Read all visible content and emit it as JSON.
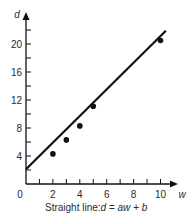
{
  "chart_data": {
    "type": "scatter",
    "title": "",
    "caption": "Straight line: d = aw + b",
    "caption_parts": {
      "prefix": "Straight line: ",
      "lhs": "d",
      "eq": " = ",
      "rhs1": "aw",
      "plus": " + ",
      "rhs2": "b"
    },
    "xlabel": "w",
    "ylabel": "d",
    "xlim": [
      0,
      11
    ],
    "ylim": [
      0,
      24
    ],
    "x_ticks_major": [
      2,
      4,
      6,
      8,
      10
    ],
    "x_ticks_minor": [
      1,
      2,
      3,
      4,
      5,
      6,
      7,
      8,
      9,
      10
    ],
    "y_ticks_major": [
      4,
      8,
      12,
      16,
      20
    ],
    "y_ticks_minor": [
      2,
      4,
      6,
      8,
      10,
      12,
      14,
      16,
      18,
      20,
      22
    ],
    "origin_label": "0",
    "grid": false,
    "legend": null,
    "points": [
      {
        "w": 2,
        "d": 4.3
      },
      {
        "w": 3,
        "d": 6.3
      },
      {
        "w": 4,
        "d": 8.3
      },
      {
        "w": 5,
        "d": 11.1
      },
      {
        "w": 10,
        "d": 20.5
      }
    ],
    "fit_line": {
      "start": {
        "w": 0,
        "d": 2.1
      },
      "end": {
        "w": 10.4,
        "d": 21.9
      },
      "slope_a": 1.9,
      "intercept_b": 2.1
    }
  },
  "colors": {
    "ink": "#111111",
    "text": "#2a2a2a",
    "background": "#ffffff"
  }
}
